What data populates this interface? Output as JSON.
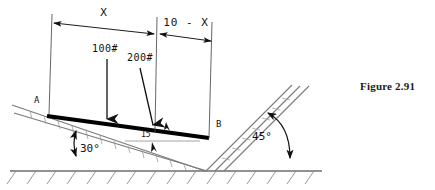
{
  "figure": {
    "caption": "Figure 2.91"
  },
  "dimensions": [
    {
      "id": "left-span",
      "label": "X"
    },
    {
      "id": "right-span",
      "label": "10 - X"
    }
  ],
  "loads": [
    {
      "id": "load-100",
      "label": "100#",
      "orientation": "vertical"
    },
    {
      "id": "load-200",
      "label": "200#",
      "orientation": "slanted"
    }
  ],
  "points": [
    {
      "id": "point-a",
      "label": "A"
    },
    {
      "id": "point-b",
      "label": "B"
    }
  ],
  "angles": [
    {
      "id": "angle-left",
      "label": "30°"
    },
    {
      "id": "angle-right",
      "label": "45°"
    }
  ],
  "annotations": [
    {
      "id": "beam-mark",
      "label": "15"
    }
  ],
  "colors": {
    "ink": "#111111",
    "line": "#555555",
    "hatch": "#8a8a8a",
    "beam": "#000000",
    "background": "#ffffff"
  }
}
